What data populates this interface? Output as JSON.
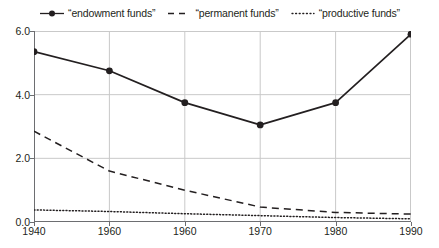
{
  "chart_data": {
    "type": "line",
    "title": "",
    "subtitle": "",
    "xlabel": "",
    "ylabel": "",
    "xlim": [
      1940,
      1990
    ],
    "ylim": [
      0.0,
      6.0
    ],
    "grid": true,
    "legend_position": "top-center",
    "x": [
      1940,
      1950,
      1960,
      1970,
      1980,
      1990
    ],
    "xtick_labels": [
      "1940",
      "1960",
      "1960",
      "1970",
      "1980",
      "1990"
    ],
    "ytick_labels": [
      "0.0",
      "2.0",
      "4.0",
      "6.0"
    ],
    "ytick_values": [
      0.0,
      2.0,
      4.0,
      6.0
    ],
    "series": [
      {
        "name": "“endowment funds”",
        "style": "solid-with-markers",
        "marker": "filled-circle",
        "color": "#231f20",
        "values": [
          5.35,
          4.75,
          3.75,
          3.05,
          3.75,
          5.9
        ]
      },
      {
        "name": "“permanent funds”",
        "style": "dashed",
        "marker": "none",
        "color": "#231f20",
        "values": [
          2.85,
          1.6,
          1.0,
          0.47,
          0.3,
          0.25
        ]
      },
      {
        "name": "“productive funds”",
        "style": "dotted",
        "marker": "none",
        "color": "#231f20",
        "values": [
          0.38,
          0.33,
          0.26,
          0.2,
          0.14,
          0.1
        ]
      }
    ]
  },
  "legend": {
    "entries": [
      {
        "label": "“endowment funds”",
        "key": "solid-marker-line-key"
      },
      {
        "label": "“permanent funds”",
        "key": "dashed-line-key"
      },
      {
        "label": "“productive funds”",
        "key": "dotted-line-key"
      }
    ]
  },
  "colors": {
    "ink": "#231f20",
    "grid": "#c9c9c9",
    "axis": "#6d6e71",
    "background": "#ffffff"
  }
}
